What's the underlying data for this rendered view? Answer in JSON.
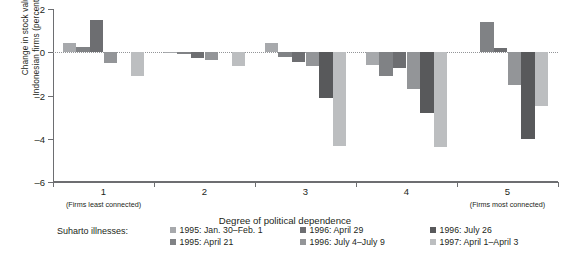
{
  "chart_data": {
    "type": "bar",
    "title": "",
    "xlabel": "Degree of political dependence",
    "ylabel": "Change in stock values of\nIndonesian firms (percentage points)",
    "ylim": [
      -6,
      2
    ],
    "yticks": [
      2,
      0,
      -2,
      -4,
      -6
    ],
    "ytick_labels": [
      "2",
      "0",
      "-2",
      "-4",
      "-6"
    ],
    "grid": false,
    "zero_reference_line": true,
    "legend_position": "below-plot",
    "legend_title": "Suharto illnesses:",
    "categories": [
      "1",
      "2",
      "3",
      "4",
      "5"
    ],
    "category_sublabels": [
      "(Firms least connected)",
      "",
      "",
      "",
      "(Firms most connected)"
    ],
    "series": [
      {
        "name": "1995: Jan. 30–Feb. 1",
        "color": "#a7a9ac",
        "values": [
          0.45,
          -0.05,
          0.45,
          -0.6,
          0.0
        ]
      },
      {
        "name": "1995: April 21",
        "color": "#808285",
        "values": [
          0.25,
          -0.1,
          -0.2,
          -1.1,
          1.4
        ]
      },
      {
        "name": "1996: April 29",
        "color": "#6d6e71",
        "values": [
          1.5,
          -0.25,
          -0.45,
          -0.75,
          0.2
        ]
      },
      {
        "name": "1996: July 4–July 9",
        "color": "#939598",
        "values": [
          -0.5,
          -0.35,
          -0.65,
          -1.7,
          -1.5
        ]
      },
      {
        "name": "1996: July 26",
        "color": "#58595b",
        "values": [
          0.0,
          0.0,
          -2.1,
          -2.8,
          -4.0
        ]
      },
      {
        "name": "1997: April 1–April 3",
        "color": "#bcbec0",
        "values": [
          -1.1,
          -0.65,
          -4.35,
          -4.4,
          -2.5
        ]
      }
    ]
  },
  "legend": {
    "title": "Suharto illnesses:",
    "columns": [
      [
        {
          "label": "1995: Jan. 30–Feb. 1",
          "color": "#a7a9ac"
        },
        {
          "label": "1995: April 21",
          "color": "#808285"
        }
      ],
      [
        {
          "label": "1996: April 29",
          "color": "#6d6e71"
        },
        {
          "label": "1996: July 4–July 9",
          "color": "#939598"
        }
      ],
      [
        {
          "label": "1996: July 26",
          "color": "#58595b"
        },
        {
          "label": "1997: April 1–April 3",
          "color": "#bcbec0"
        }
      ]
    ]
  },
  "axes": {
    "y_title": "Change in stock values of\nIndonesian firms (percentage points)",
    "x_title": "Degree of political dependence"
  }
}
